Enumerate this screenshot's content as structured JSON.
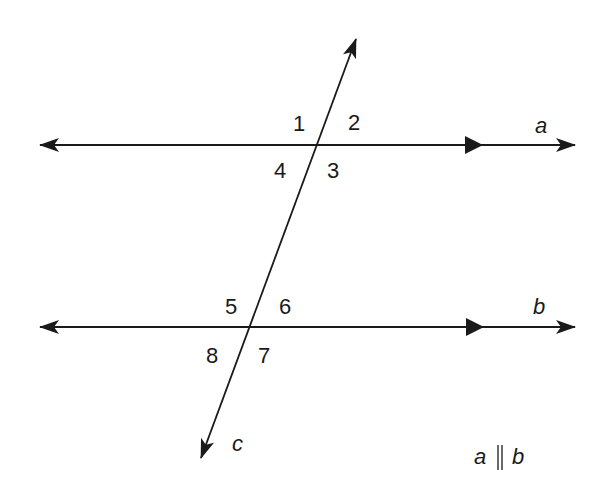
{
  "diagram": {
    "colors": {
      "line": "#1a1a1a",
      "background": "#ffffff"
    },
    "lines": {
      "a": {
        "label": "a",
        "y": 145,
        "x_start": 38,
        "x_end": 576,
        "parallel_mark": true
      },
      "b": {
        "label": "b",
        "y": 327,
        "x_start": 38,
        "x_end": 576,
        "parallel_mark": true
      },
      "c": {
        "label": "c",
        "from": [
          200,
          460
        ],
        "to": [
          357,
          37
        ],
        "role": "transversal"
      }
    },
    "angles": [
      {
        "label": "1",
        "x": 300,
        "y": 131
      },
      {
        "label": "2",
        "x": 356,
        "y": 129
      },
      {
        "label": "3",
        "x": 335,
        "y": 178
      },
      {
        "label": "4",
        "x": 282,
        "y": 178
      },
      {
        "label": "5",
        "x": 232,
        "y": 313
      },
      {
        "label": "6",
        "x": 286,
        "y": 313
      },
      {
        "label": "7",
        "x": 265,
        "y": 363
      },
      {
        "label": "8",
        "x": 214,
        "y": 363
      }
    ],
    "line_labels": {
      "a": "a",
      "b": "b",
      "c": "c"
    },
    "caption": {
      "left": "a",
      "symbol": "∥",
      "right": "b"
    }
  }
}
